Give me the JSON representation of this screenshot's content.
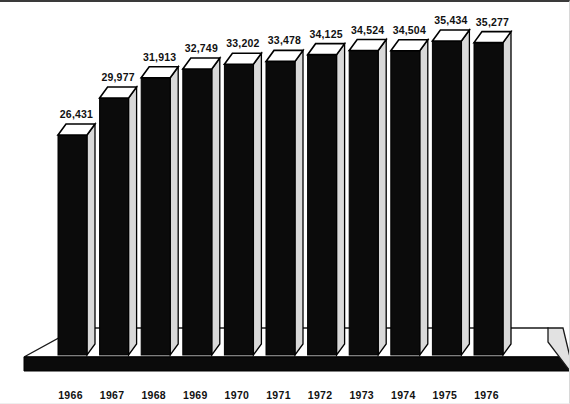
{
  "chart_data": {
    "type": "bar",
    "title": "",
    "subtitle": "",
    "xlabel": "",
    "ylabel": "",
    "grid": false,
    "legend": "none",
    "style": "3d-block-bars-on-perspective-slab",
    "ylim": [
      0,
      36000
    ],
    "categories": [
      "1966",
      "1967",
      "1968",
      "1969",
      "1970",
      "1971",
      "1972",
      "1973",
      "1974",
      "1975",
      "1976"
    ],
    "values": [
      26431,
      29977,
      31913,
      32749,
      33202,
      33478,
      34125,
      34524,
      34504,
      35434,
      35277
    ],
    "value_labels": [
      "26,431",
      "29,977",
      "31,913",
      "32,749",
      "33,202",
      "33,478",
      "34,125",
      "34,524",
      "34,504",
      "35,434",
      "35,277"
    ],
    "tick_labels": [
      "1966",
      "1967",
      "1968",
      "1969",
      "1970",
      "1971",
      "1972",
      "1973",
      "1974",
      "1975",
      "1976"
    ],
    "points": [
      {
        "category": "1966",
        "value": 26431,
        "label": "26,431"
      },
      {
        "category": "1967",
        "value": 29977,
        "label": "29,977"
      },
      {
        "category": "1968",
        "value": 31913,
        "label": "31,913"
      },
      {
        "category": "1969",
        "value": 32749,
        "label": "32,749"
      },
      {
        "category": "1970",
        "value": 33202,
        "label": "33,202"
      },
      {
        "category": "1971",
        "value": 33478,
        "label": "33,478"
      },
      {
        "category": "1972",
        "value": 34125,
        "label": "34,125"
      },
      {
        "category": "1973",
        "value": 34524,
        "label": "34,524"
      },
      {
        "category": "1974",
        "value": 34504,
        "label": "34,504"
      },
      {
        "category": "1975",
        "value": 35434,
        "label": "35,434"
      },
      {
        "category": "1976",
        "value": 35277,
        "label": "35,277"
      }
    ],
    "colors": {
      "bar_front": "#0b0b0b",
      "bar_top": "#ffffff",
      "bar_side": "#d9d9d9",
      "slab_top": "#ffffff",
      "slab_front": "#0b0b0b",
      "slab_right": "#e2e2e2",
      "text": "#111111",
      "background": "#ffffff"
    }
  }
}
